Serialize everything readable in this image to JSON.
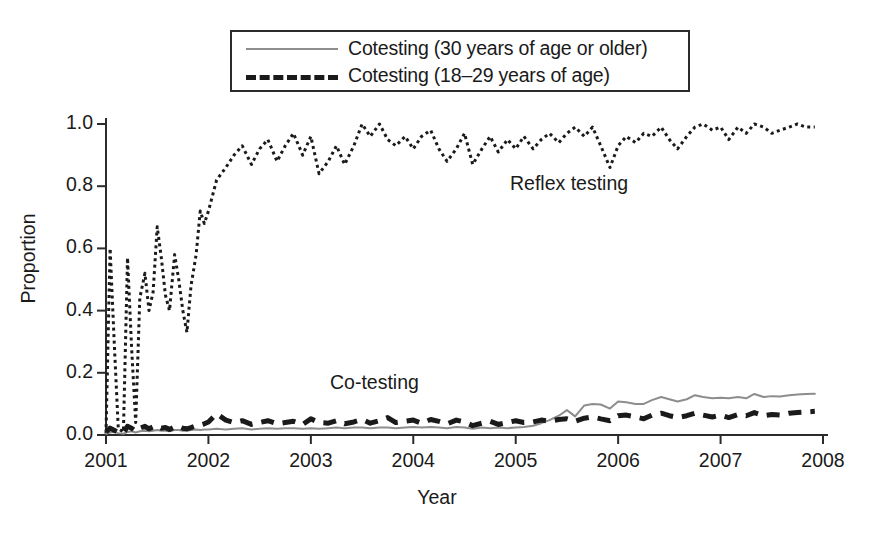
{
  "legend": {
    "entries": [
      {
        "label": "Cotesting (30 years of age or older)",
        "style": "solid-gray",
        "color": "#8d8d8d"
      },
      {
        "label": "Cotesting (18–29 years of age)",
        "style": "dashed-black",
        "color": "#1a1a1a"
      }
    ]
  },
  "annotations": [
    {
      "text": "Reflex testing",
      "x": 510,
      "y": 172
    },
    {
      "text": "Co-testing",
      "x": 330,
      "y": 371
    }
  ],
  "chart_data": {
    "type": "line",
    "title": "",
    "xlabel": "Year",
    "ylabel": "Proportion",
    "xlim": [
      2001,
      2008
    ],
    "ylim": [
      0.0,
      1.0
    ],
    "grid": false,
    "legend_position": "top-center",
    "xticks": [
      "2001",
      "2002",
      "2003",
      "2004",
      "2005",
      "2006",
      "2007",
      "2008"
    ],
    "ytick_labels": [
      "0.0",
      "0.2",
      "0.4",
      "0.6",
      "0.8",
      "1.0"
    ],
    "yticks": [
      0.0,
      0.2,
      0.4,
      0.6,
      0.8,
      1.0
    ],
    "x": [
      2001.0,
      2001.04,
      2001.08,
      2001.12,
      2001.17,
      2001.21,
      2001.25,
      2001.29,
      2001.33,
      2001.38,
      2001.42,
      2001.46,
      2001.5,
      2001.54,
      2001.58,
      2001.62,
      2001.67,
      2001.71,
      2001.75,
      2001.79,
      2001.83,
      2001.88,
      2001.92,
      2001.96,
      2002.0,
      2002.08,
      2002.17,
      2002.25,
      2002.33,
      2002.42,
      2002.5,
      2002.58,
      2002.67,
      2002.75,
      2002.83,
      2002.92,
      2003.0,
      2003.08,
      2003.17,
      2003.25,
      2003.33,
      2003.42,
      2003.5,
      2003.58,
      2003.67,
      2003.75,
      2003.83,
      2003.92,
      2004.0,
      2004.08,
      2004.17,
      2004.25,
      2004.33,
      2004.42,
      2004.5,
      2004.58,
      2004.67,
      2004.75,
      2004.83,
      2004.92,
      2005.0,
      2005.08,
      2005.17,
      2005.25,
      2005.33,
      2005.42,
      2005.5,
      2005.58,
      2005.67,
      2005.75,
      2005.83,
      2005.92,
      2006.0,
      2006.08,
      2006.17,
      2006.25,
      2006.33,
      2006.42,
      2006.5,
      2006.58,
      2006.67,
      2006.75,
      2006.83,
      2006.92,
      2007.0,
      2007.08,
      2007.17,
      2007.25,
      2007.33,
      2007.42,
      2007.5,
      2007.58,
      2007.67,
      2007.75,
      2007.83,
      2007.92
    ],
    "series": [
      {
        "name": "Reflex testing",
        "style": "dotted",
        "color": "#1a1a1a",
        "width": 3,
        "annotated_in_plot": true,
        "values": [
          0.005,
          0.6,
          0.3,
          0.02,
          0.01,
          0.57,
          0.28,
          0.04,
          0.44,
          0.52,
          0.4,
          0.46,
          0.67,
          0.57,
          0.45,
          0.4,
          0.58,
          0.5,
          0.4,
          0.33,
          0.48,
          0.58,
          0.72,
          0.68,
          0.72,
          0.82,
          0.86,
          0.9,
          0.93,
          0.87,
          0.92,
          0.95,
          0.88,
          0.93,
          0.97,
          0.9,
          0.96,
          0.84,
          0.88,
          0.93,
          0.87,
          0.93,
          1.0,
          0.96,
          1.0,
          0.95,
          0.93,
          0.96,
          0.92,
          0.96,
          0.98,
          0.92,
          0.88,
          0.92,
          0.97,
          0.87,
          0.92,
          0.96,
          0.91,
          0.95,
          0.92,
          0.96,
          0.92,
          0.95,
          0.97,
          0.94,
          0.97,
          0.99,
          0.96,
          0.99,
          0.93,
          0.86,
          0.93,
          0.96,
          0.94,
          0.97,
          0.96,
          0.99,
          0.95,
          0.92,
          0.96,
          0.99,
          1.0,
          0.98,
          0.99,
          0.95,
          0.99,
          0.97,
          1.0,
          0.99,
          0.97,
          0.98,
          0.99,
          1.0,
          0.99,
          0.99
        ]
      },
      {
        "name": "Cotesting (30 years of age or older)",
        "style": "solid",
        "color": "#8d8d8d",
        "width": 2,
        "values": [
          0.004,
          0.008,
          0.01,
          0.006,
          0.004,
          0.01,
          0.012,
          0.008,
          0.012,
          0.014,
          0.012,
          0.014,
          0.016,
          0.014,
          0.014,
          0.012,
          0.016,
          0.016,
          0.014,
          0.014,
          0.016,
          0.018,
          0.016,
          0.018,
          0.018,
          0.02,
          0.018,
          0.02,
          0.022,
          0.018,
          0.02,
          0.022,
          0.02,
          0.022,
          0.022,
          0.02,
          0.022,
          0.02,
          0.022,
          0.024,
          0.022,
          0.024,
          0.024,
          0.022,
          0.024,
          0.024,
          0.022,
          0.024,
          0.026,
          0.024,
          0.026,
          0.024,
          0.022,
          0.026,
          0.024,
          0.02,
          0.024,
          0.022,
          0.024,
          0.022,
          0.024,
          0.026,
          0.03,
          0.038,
          0.048,
          0.062,
          0.08,
          0.06,
          0.095,
          0.1,
          0.098,
          0.085,
          0.108,
          0.105,
          0.1,
          0.1,
          0.112,
          0.122,
          0.115,
          0.108,
          0.115,
          0.128,
          0.122,
          0.118,
          0.12,
          0.118,
          0.122,
          0.118,
          0.132,
          0.122,
          0.125,
          0.124,
          0.128,
          0.13,
          0.132,
          0.133
        ]
      },
      {
        "name": "Cotesting (18–29 years of age)",
        "style": "dashed",
        "color": "#1a1a1a",
        "width": 5,
        "values": [
          0.01,
          0.022,
          0.015,
          0.008,
          0.006,
          0.028,
          0.022,
          0.012,
          0.022,
          0.028,
          0.02,
          0.026,
          0.03,
          0.022,
          0.024,
          0.018,
          0.026,
          0.028,
          0.022,
          0.02,
          0.024,
          0.03,
          0.032,
          0.036,
          0.042,
          0.068,
          0.048,
          0.04,
          0.046,
          0.034,
          0.04,
          0.046,
          0.036,
          0.04,
          0.044,
          0.034,
          0.052,
          0.04,
          0.038,
          0.046,
          0.036,
          0.042,
          0.05,
          0.038,
          0.046,
          0.056,
          0.04,
          0.044,
          0.048,
          0.038,
          0.05,
          0.044,
          0.036,
          0.048,
          0.042,
          0.03,
          0.038,
          0.044,
          0.034,
          0.04,
          0.046,
          0.04,
          0.042,
          0.048,
          0.044,
          0.05,
          0.052,
          0.044,
          0.054,
          0.058,
          0.052,
          0.046,
          0.062,
          0.064,
          0.058,
          0.052,
          0.064,
          0.07,
          0.062,
          0.056,
          0.062,
          0.07,
          0.064,
          0.058,
          0.064,
          0.056,
          0.066,
          0.062,
          0.072,
          0.062,
          0.066,
          0.064,
          0.07,
          0.072,
          0.074,
          0.076
        ]
      }
    ]
  }
}
